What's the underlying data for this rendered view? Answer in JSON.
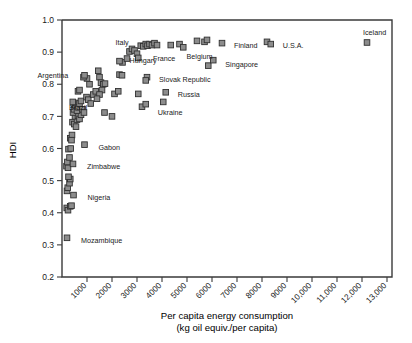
{
  "chart_data": {
    "type": "scatter",
    "title": "",
    "xlabel": "Per capita energy consumption",
    "xlabel_line2": "(kg oil equiv./per capita)",
    "ylabel": "HDI",
    "xlim": [
      0,
      13200
    ],
    "ylim": [
      0.2,
      1.0
    ],
    "grid": false,
    "legend": "none",
    "marker_style": "filled-square",
    "marker_fill": "#8c8c8c",
    "marker_stroke": "#303030",
    "xticks": [
      1000,
      2000,
      3000,
      4000,
      5000,
      6000,
      7000,
      8000,
      9000,
      10000,
      11000,
      12000,
      13000
    ],
    "xticklabels": [
      "1000",
      "2000",
      "3000",
      "4000",
      "5000",
      "6000",
      "7000",
      "8000",
      "9000",
      "10,000",
      "11,000",
      "12,000",
      "13,000"
    ],
    "yticks": [
      0.2,
      0.3,
      0.4,
      0.5,
      0.6,
      0.7,
      0.8,
      0.9,
      1.0
    ],
    "yticklabels": [
      "0.2",
      "0.3",
      "0.4",
      "0.5",
      "0.6",
      "0.7",
      "0.8",
      "0.9",
      "1.0"
    ],
    "points": [
      {
        "x": 200,
        "y": 0.322,
        "label": "Mozambique",
        "lx": 14,
        "ly": 3
      },
      {
        "x": 190,
        "y": 0.415,
        "label": "",
        "lx": 0,
        "ly": 0
      },
      {
        "x": 240,
        "y": 0.408,
        "label": "",
        "lx": 0,
        "ly": 0
      },
      {
        "x": 330,
        "y": 0.42,
        "label": "",
        "lx": 0,
        "ly": 0
      },
      {
        "x": 380,
        "y": 0.422,
        "label": "",
        "lx": 0,
        "ly": 0
      },
      {
        "x": 460,
        "y": 0.455,
        "label": "Nigeria",
        "lx": 14,
        "ly": 3
      },
      {
        "x": 200,
        "y": 0.468,
        "label": "",
        "lx": 0,
        "ly": 0
      },
      {
        "x": 230,
        "y": 0.478,
        "label": "",
        "lx": 0,
        "ly": 0
      },
      {
        "x": 300,
        "y": 0.492,
        "label": "",
        "lx": 0,
        "ly": 0
      },
      {
        "x": 330,
        "y": 0.505,
        "label": "",
        "lx": 0,
        "ly": 0
      },
      {
        "x": 260,
        "y": 0.512,
        "label": "",
        "lx": 0,
        "ly": 0
      },
      {
        "x": 180,
        "y": 0.545,
        "label": "",
        "lx": 0,
        "ly": 0
      },
      {
        "x": 240,
        "y": 0.54,
        "label": "",
        "lx": 0,
        "ly": 0
      },
      {
        "x": 215,
        "y": 0.558,
        "label": "",
        "lx": 0,
        "ly": 0
      },
      {
        "x": 300,
        "y": 0.572,
        "label": "",
        "lx": 0,
        "ly": 0
      },
      {
        "x": 440,
        "y": 0.552,
        "label": "Zimbabwe",
        "lx": 14,
        "ly": 3
      },
      {
        "x": 260,
        "y": 0.598,
        "label": "",
        "lx": 0,
        "ly": 0
      },
      {
        "x": 350,
        "y": 0.6,
        "label": "",
        "lx": 0,
        "ly": 0
      },
      {
        "x": 900,
        "y": 0.612,
        "label": "Gabon",
        "lx": 14,
        "ly": 3
      },
      {
        "x": 330,
        "y": 0.632,
        "label": "",
        "lx": 0,
        "ly": 0
      },
      {
        "x": 400,
        "y": 0.642,
        "label": "",
        "lx": 0,
        "ly": 0
      },
      {
        "x": 380,
        "y": 0.626,
        "label": "",
        "lx": 0,
        "ly": 0
      },
      {
        "x": 420,
        "y": 0.682,
        "label": "",
        "lx": 0,
        "ly": 0
      },
      {
        "x": 490,
        "y": 0.676,
        "label": "",
        "lx": 0,
        "ly": 0
      },
      {
        "x": 560,
        "y": 0.668,
        "label": "",
        "lx": 0,
        "ly": 0
      },
      {
        "x": 600,
        "y": 0.69,
        "label": "",
        "lx": 0,
        "ly": 0
      },
      {
        "x": 520,
        "y": 0.7,
        "label": "",
        "lx": 0,
        "ly": 0
      },
      {
        "x": 640,
        "y": 0.702,
        "label": "",
        "lx": 0,
        "ly": 0
      },
      {
        "x": 700,
        "y": 0.692,
        "label": "",
        "lx": 0,
        "ly": 0
      },
      {
        "x": 760,
        "y": 0.705,
        "label": "",
        "lx": 0,
        "ly": 0
      },
      {
        "x": 440,
        "y": 0.712,
        "label": "",
        "lx": 0,
        "ly": 0
      },
      {
        "x": 480,
        "y": 0.722,
        "label": "",
        "lx": 0,
        "ly": 0
      },
      {
        "x": 520,
        "y": 0.735,
        "label": "",
        "lx": 0,
        "ly": 0
      },
      {
        "x": 560,
        "y": 0.742,
        "label": "",
        "lx": 0,
        "ly": 0
      },
      {
        "x": 430,
        "y": 0.745,
        "label": "",
        "lx": 0,
        "ly": 0
      },
      {
        "x": 600,
        "y": 0.718,
        "label": "",
        "lx": 0,
        "ly": 0
      },
      {
        "x": 660,
        "y": 0.728,
        "label": "",
        "lx": 0,
        "ly": 0
      },
      {
        "x": 700,
        "y": 0.74,
        "label": "",
        "lx": 0,
        "ly": 0
      },
      {
        "x": 760,
        "y": 0.748,
        "label": "",
        "lx": 0,
        "ly": 0
      },
      {
        "x": 820,
        "y": 0.722,
        "label": "",
        "lx": 0,
        "ly": 0
      },
      {
        "x": 880,
        "y": 0.712,
        "label": "",
        "lx": 0,
        "ly": 0
      },
      {
        "x": 640,
        "y": 0.778,
        "label": "",
        "lx": 0,
        "ly": 0
      },
      {
        "x": 700,
        "y": 0.782,
        "label": "",
        "lx": 0,
        "ly": 0
      },
      {
        "x": 980,
        "y": 0.76,
        "label": "",
        "lx": 0,
        "ly": 0
      },
      {
        "x": 1050,
        "y": 0.752,
        "label": "",
        "lx": 0,
        "ly": 0
      },
      {
        "x": 1150,
        "y": 0.74,
        "label": "",
        "lx": 0,
        "ly": 0
      },
      {
        "x": 1250,
        "y": 0.768,
        "label": "",
        "lx": 0,
        "ly": 0
      },
      {
        "x": 1350,
        "y": 0.778,
        "label": "",
        "lx": 0,
        "ly": 0
      },
      {
        "x": 1100,
        "y": 0.8,
        "label": "",
        "lx": 0,
        "ly": 0
      },
      {
        "x": 1000,
        "y": 0.818,
        "label": "",
        "lx": 0,
        "ly": 0
      },
      {
        "x": 860,
        "y": 0.822,
        "label": "Argentina",
        "lx": -46,
        "ly": -2
      },
      {
        "x": 900,
        "y": 0.828,
        "label": "",
        "lx": 0,
        "ly": 0
      },
      {
        "x": 1450,
        "y": 0.842,
        "label": "",
        "lx": 0,
        "ly": 0
      },
      {
        "x": 1500,
        "y": 0.822,
        "label": "",
        "lx": 0,
        "ly": 0
      },
      {
        "x": 1560,
        "y": 0.805,
        "label": "",
        "lx": 0,
        "ly": 0
      },
      {
        "x": 1650,
        "y": 0.8,
        "label": "",
        "lx": 0,
        "ly": 0
      },
      {
        "x": 1720,
        "y": 0.802,
        "label": "",
        "lx": 0,
        "ly": 0
      },
      {
        "x": 1600,
        "y": 0.782,
        "label": "",
        "lx": 0,
        "ly": 0
      },
      {
        "x": 1500,
        "y": 0.768,
        "label": "",
        "lx": 0,
        "ly": 0
      },
      {
        "x": 1400,
        "y": 0.755,
        "label": "Brazil",
        "lx": -28,
        "ly": 9
      },
      {
        "x": 1700,
        "y": 0.712,
        "label": "",
        "lx": 0,
        "ly": 0
      },
      {
        "x": 2000,
        "y": 0.7,
        "label": "",
        "lx": 0,
        "ly": 0
      },
      {
        "x": 2100,
        "y": 0.77,
        "label": "",
        "lx": 0,
        "ly": 0
      },
      {
        "x": 2250,
        "y": 0.778,
        "label": "",
        "lx": 0,
        "ly": 0
      },
      {
        "x": 2300,
        "y": 0.83,
        "label": "Hungary",
        "lx": 10,
        "ly": -14
      },
      {
        "x": 2400,
        "y": 0.828,
        "label": "",
        "lx": 0,
        "ly": 0
      },
      {
        "x": 2420,
        "y": 0.868,
        "label": "",
        "lx": 0,
        "ly": 0
      },
      {
        "x": 2300,
        "y": 0.872,
        "label": "",
        "lx": 0,
        "ly": 0
      },
      {
        "x": 2600,
        "y": 0.88,
        "label": "",
        "lx": 0,
        "ly": 0
      },
      {
        "x": 2700,
        "y": 0.902,
        "label": "Italy",
        "lx": -14,
        "ly": -9
      },
      {
        "x": 2800,
        "y": 0.91,
        "label": "",
        "lx": 0,
        "ly": 0
      },
      {
        "x": 2900,
        "y": 0.905,
        "label": "",
        "lx": 0,
        "ly": 0
      },
      {
        "x": 3000,
        "y": 0.895,
        "label": "",
        "lx": 0,
        "ly": 0
      },
      {
        "x": 3050,
        "y": 0.882,
        "label": "",
        "lx": 0,
        "ly": 0
      },
      {
        "x": 3150,
        "y": 0.92,
        "label": "",
        "lx": 0,
        "ly": 0
      },
      {
        "x": 3250,
        "y": 0.918,
        "label": "",
        "lx": 0,
        "ly": 0
      },
      {
        "x": 3350,
        "y": 0.925,
        "label": "",
        "lx": 0,
        "ly": 0
      },
      {
        "x": 3420,
        "y": 0.92,
        "label": "",
        "lx": 0,
        "ly": 0
      },
      {
        "x": 3500,
        "y": 0.925,
        "label": "",
        "lx": 0,
        "ly": 0
      },
      {
        "x": 3600,
        "y": 0.922,
        "label": "",
        "lx": 0,
        "ly": 0
      },
      {
        "x": 3700,
        "y": 0.928,
        "label": "",
        "lx": 0,
        "ly": 0
      },
      {
        "x": 3800,
        "y": 0.922,
        "label": "France",
        "lx": -4,
        "ly": 14
      },
      {
        "x": 3400,
        "y": 0.822,
        "label": "Slovak Republic",
        "lx": 12,
        "ly": 2
      },
      {
        "x": 3350,
        "y": 0.812,
        "label": "",
        "lx": 0,
        "ly": 0
      },
      {
        "x": 3200,
        "y": 0.73,
        "label": "",
        "lx": 0,
        "ly": 0
      },
      {
        "x": 3350,
        "y": 0.738,
        "label": "Ukraine",
        "lx": 12,
        "ly": 8
      },
      {
        "x": 3050,
        "y": 0.77,
        "label": "",
        "lx": 0,
        "ly": 0
      },
      {
        "x": 4050,
        "y": 0.745,
        "label": "",
        "lx": 0,
        "ly": 0
      },
      {
        "x": 4150,
        "y": 0.775,
        "label": "Russia",
        "lx": 12,
        "ly": 2
      },
      {
        "x": 4350,
        "y": 0.922,
        "label": "",
        "lx": 0,
        "ly": 0
      },
      {
        "x": 4700,
        "y": 0.925,
        "label": "",
        "lx": 0,
        "ly": 0
      },
      {
        "x": 4850,
        "y": 0.915,
        "label": "",
        "lx": 0,
        "ly": 0
      },
      {
        "x": 5400,
        "y": 0.935,
        "label": "",
        "lx": 0,
        "ly": 0
      },
      {
        "x": 5700,
        "y": 0.932,
        "label": "Belgium",
        "lx": -18,
        "ly": 15
      },
      {
        "x": 5800,
        "y": 0.938,
        "label": "",
        "lx": 0,
        "ly": 0
      },
      {
        "x": 5850,
        "y": 0.858,
        "label": "",
        "lx": 0,
        "ly": 0
      },
      {
        "x": 6050,
        "y": 0.875,
        "label": "Singapore",
        "lx": 12,
        "ly": 4
      },
      {
        "x": 6400,
        "y": 0.928,
        "label": "Finland",
        "lx": 12,
        "ly": 2
      },
      {
        "x": 8200,
        "y": 0.932,
        "label": "",
        "lx": 0,
        "ly": 0
      },
      {
        "x": 8350,
        "y": 0.925,
        "label": "U.S.A.",
        "lx": 12,
        "ly": 2
      },
      {
        "x": 12200,
        "y": 0.93,
        "label": "Iceland",
        "lx": -4,
        "ly": -10
      }
    ]
  }
}
